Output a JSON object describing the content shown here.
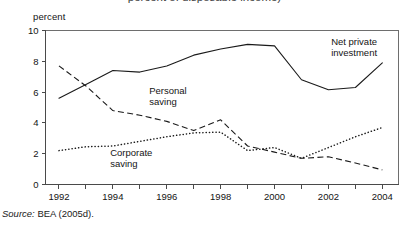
{
  "figure": {
    "title_clipped": "percent of disposable income)",
    "y_axis_unit": "percent",
    "source_prefix": "Source:",
    "source_text": "BEA (2005d)."
  },
  "chart_data": {
    "type": "line",
    "title": "percent of disposable income)",
    "xlabel": "",
    "ylabel": "percent",
    "ylim": [
      0,
      10
    ],
    "xlim": [
      1991.5,
      2004.6
    ],
    "yticks": [
      "0",
      "2",
      "4",
      "6",
      "8",
      "10"
    ],
    "xticks": [
      "1992",
      "1994",
      "1996",
      "1998",
      "2000",
      "2002",
      "2004"
    ],
    "grid": false,
    "legend": "inline-annotations",
    "x": [
      1992,
      1993,
      1994,
      1995,
      1996,
      1997,
      1998,
      1999,
      2000,
      2001,
      2002,
      2003,
      2004
    ],
    "series": [
      {
        "name": "Net private investment",
        "style": "solid",
        "label_x": 2002.1,
        "label_y": 9.05,
        "values": [
          5.6,
          6.5,
          7.4,
          7.3,
          7.7,
          8.4,
          8.8,
          9.1,
          9.0,
          6.8,
          6.15,
          6.3,
          7.9
        ]
      },
      {
        "name": "Personal saving",
        "style": "dashed",
        "label_x": 1995.35,
        "label_y": 5.85,
        "values": [
          7.7,
          6.4,
          4.8,
          4.5,
          4.1,
          3.5,
          4.2,
          2.5,
          2.1,
          1.7,
          1.8,
          1.4,
          0.95
        ]
      },
      {
        "name": "Corporate saving",
        "style": "dotted",
        "label_x": 1993.9,
        "label_y": 1.85,
        "values": [
          2.2,
          2.45,
          2.5,
          2.8,
          3.1,
          3.35,
          3.4,
          2.2,
          2.4,
          1.7,
          2.4,
          3.1,
          3.7
        ]
      }
    ],
    "annotations": [
      {
        "text": "Net private investment",
        "series": "Net private investment"
      },
      {
        "text": "Personal saving",
        "series": "Personal saving"
      },
      {
        "text": "Corporate saving",
        "series": "Corporate saving"
      }
    ]
  }
}
